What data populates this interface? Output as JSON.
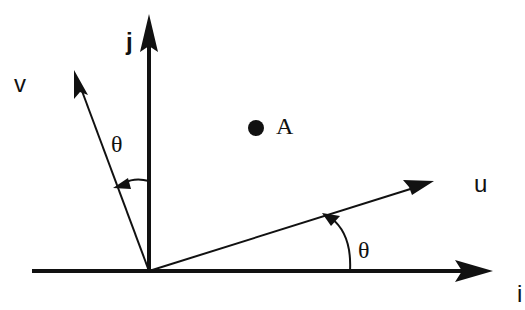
{
  "diagram": {
    "origin": {
      "x": 149,
      "y": 271
    },
    "axes": [
      {
        "id": "i",
        "label": "i",
        "tip": {
          "x": 493,
          "y": 271
        },
        "label_pos": {
          "x": 517,
          "y": 302
        }
      },
      {
        "id": "j",
        "label": "j",
        "tip": {
          "x": 149,
          "y": 14
        },
        "label_pos": {
          "x": 126,
          "y": 50
        }
      }
    ],
    "vectors": [
      {
        "id": "u",
        "label": "u",
        "tip": {
          "x": 434,
          "y": 181
        },
        "label_pos": {
          "x": 474,
          "y": 192
        }
      },
      {
        "id": "v",
        "label": "v",
        "tip": {
          "x": 74,
          "y": 70
        },
        "label_pos": {
          "x": 14,
          "y": 92
        }
      }
    ],
    "angles": [
      {
        "id": "theta-u",
        "label": "θ",
        "between": [
          "i",
          "u"
        ],
        "label_pos": {
          "x": 358,
          "y": 258
        }
      },
      {
        "id": "theta-v",
        "label": "θ",
        "between": [
          "j",
          "v"
        ],
        "label_pos": {
          "x": 111,
          "y": 152
        }
      }
    ],
    "points": [
      {
        "id": "A",
        "label": "A",
        "pos": {
          "x": 256,
          "y": 128
        },
        "label_pos": {
          "x": 276,
          "y": 134
        }
      }
    ],
    "colors": {
      "ink": "#111111",
      "background": "#ffffff"
    }
  }
}
